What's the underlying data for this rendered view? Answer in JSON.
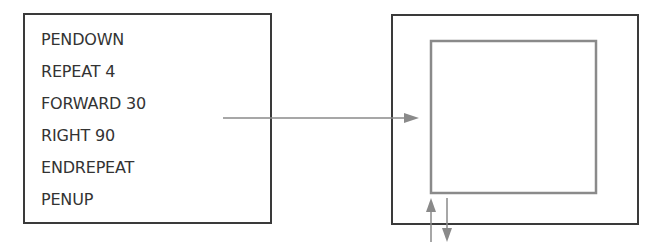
{
  "program": {
    "lines": [
      "PENDOWN",
      "REPEAT 4",
      "FORWARD 30",
      "RIGHT 90",
      "ENDREPEAT",
      "PENUP"
    ]
  },
  "output": {
    "shape": "square",
    "description": "Square drawn by turtle; arrows mark pen start (up) and end (down) positions"
  },
  "colors": {
    "text": "#333333",
    "box_border": "#3a3a3a",
    "drawing_line": "#8a8a8a"
  }
}
